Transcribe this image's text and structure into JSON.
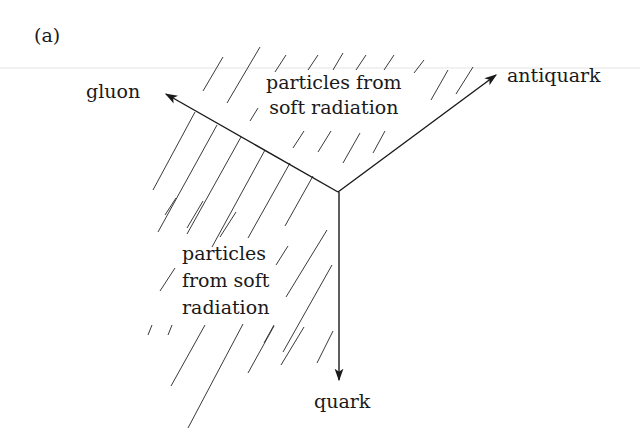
{
  "figure": {
    "panel_label": "(a)",
    "colors": {
      "ink": "#1a1a1a",
      "hatch": "#3a3a3a",
      "faint_rule": "#e6e6e6",
      "background": "#ffffff"
    }
  },
  "particles": {
    "gluon": {
      "label": "gluon"
    },
    "antiquark": {
      "label": "antiquark"
    },
    "quark": {
      "label": "quark"
    }
  },
  "regions": {
    "top": {
      "lines": [
        "particles from",
        "soft radiation"
      ]
    },
    "left": {
      "lines": [
        "particles",
        "from soft",
        "radiation"
      ]
    }
  }
}
